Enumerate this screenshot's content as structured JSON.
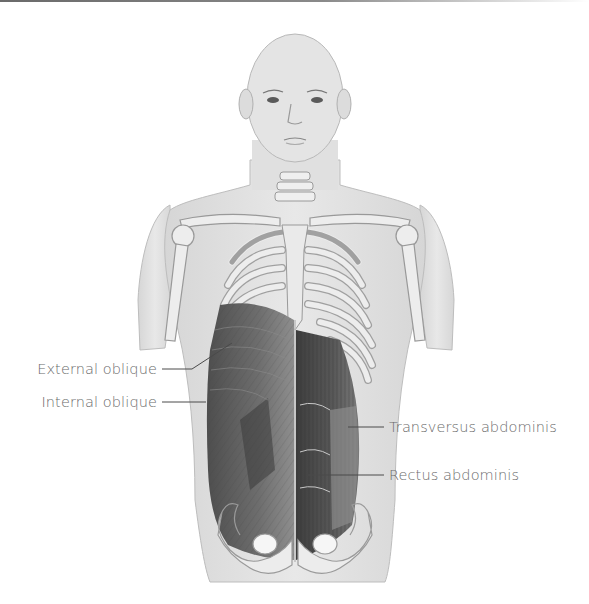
{
  "diagram": {
    "labels": [
      {
        "id": "external-oblique",
        "text": "External oblique",
        "side": "left"
      },
      {
        "id": "internal-oblique",
        "text": "Internal oblique",
        "side": "left"
      },
      {
        "id": "transversus-abdominis",
        "text": "Transversus abdominis",
        "side": "right"
      },
      {
        "id": "rectus-abdominis",
        "text": "Rectus abdominis",
        "side": "right"
      }
    ],
    "colors": {
      "skin": "#e2e2e2",
      "skin_outline": "#b5b5b5",
      "bone": "#ececec",
      "bone_outline": "#9a9a9a",
      "muscle_dark": "#555555",
      "muscle_mid": "#7a7a7a",
      "label_text": "#6b6b6b",
      "leader_line": "#4a4a4a"
    }
  }
}
